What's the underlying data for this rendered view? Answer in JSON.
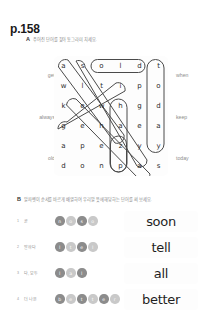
{
  "page_label": "p.158",
  "colors": {
    "text_dark": "#1f1f1f",
    "text_muted": "#8d8d8d",
    "circle_dark": "#8c8c8c",
    "circle_light": "#c9c9c9",
    "outline": "#4a4a4a",
    "card_bg": "#fdfdfd"
  },
  "section_a": {
    "letter": "A",
    "instruction": "주어진 단어를 찾아 동그라미 치세요.",
    "grid": {
      "rows": 6,
      "cols": 6,
      "letters": [
        [
          "a",
          "s",
          "o",
          "l",
          "d",
          "t"
        ],
        [
          "w",
          "l",
          "t",
          "i",
          "p",
          "o"
        ],
        [
          "k",
          "e",
          "w",
          "h",
          "g",
          "d"
        ],
        [
          "g",
          "e",
          "h",
          "a",
          "e",
          "a"
        ],
        [
          "a",
          "p",
          "e",
          "z",
          "y",
          "y"
        ],
        [
          "d",
          "o",
          "n",
          "p",
          "a",
          "s"
        ]
      ]
    },
    "left_words": [
      "get",
      "always",
      "old"
    ],
    "right_words": [
      "when",
      "keep",
      "today"
    ]
  },
  "section_b": {
    "letter": "B",
    "instruction": "알파벳이 순서를 바르게 배열하여 우리말 뜻에 해당하는 단어를 써 보세요.",
    "items": [
      {
        "index": "1",
        "korean": "곧",
        "letters": [
          "n",
          "o",
          "s",
          "o"
        ],
        "shades": [
          "dark",
          "light",
          "dark",
          "light"
        ],
        "answer": "soon"
      },
      {
        "index": "2",
        "korean": "말하다",
        "letters": [
          "l",
          "t",
          "e",
          "l"
        ],
        "shades": [
          "dark",
          "light",
          "dark",
          "light"
        ],
        "answer": "tell"
      },
      {
        "index": "3",
        "korean": "다, 모두",
        "letters": [
          "l",
          "a",
          "l"
        ],
        "shades": [
          "dark",
          "light",
          "dark"
        ],
        "answer": "all"
      },
      {
        "index": "4",
        "korean": "더 나은",
        "letters": [
          "b",
          "e",
          "t",
          "t",
          "e",
          "r"
        ],
        "shades": [
          "dark",
          "light",
          "dark",
          "light",
          "dark",
          "light"
        ],
        "answer": "better"
      }
    ]
  }
}
